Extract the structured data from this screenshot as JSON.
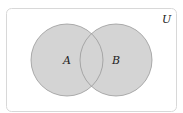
{
  "diagram": {
    "type": "venn",
    "universe_label": "U",
    "sets": [
      {
        "label": "A",
        "fill": "#d4d4d4",
        "stroke": "#999999"
      },
      {
        "label": "B",
        "fill": "#d4d4d4",
        "stroke": "#999999"
      }
    ],
    "shaded_region": "A ∪ B",
    "colors": {
      "background": "#ffffff",
      "universe_border": "#d8d8d8",
      "set_fill": "#d4d4d4",
      "set_stroke": "#999999"
    }
  }
}
